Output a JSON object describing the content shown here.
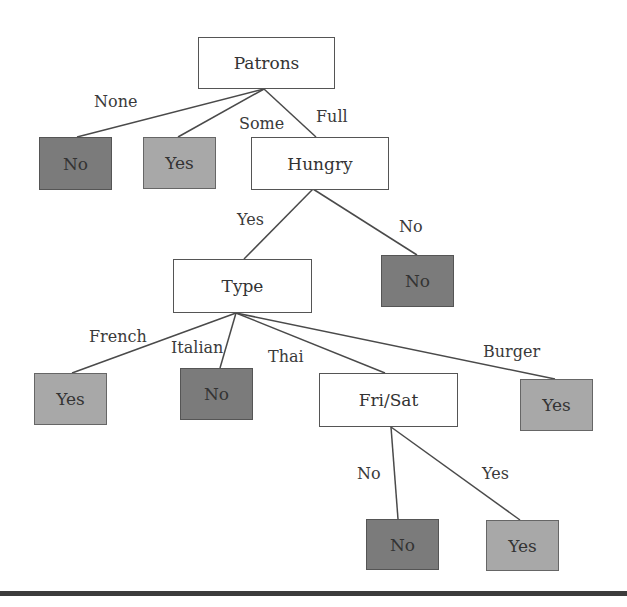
{
  "diagram": {
    "type": "decision-tree",
    "colors": {
      "decision_fill": "#ffffff",
      "leaf_yes_fill": "#a8a8a8",
      "leaf_no_fill": "#7b7b7b",
      "line": "#4a4a4a",
      "rule": "#3c3c3c"
    },
    "nodes": {
      "patrons": {
        "label": "Patrons",
        "kind": "decision"
      },
      "patrons_none": {
        "label": "No",
        "kind": "leaf-no"
      },
      "patrons_some": {
        "label": "Yes",
        "kind": "leaf-yes"
      },
      "hungry": {
        "label": "Hungry",
        "kind": "decision"
      },
      "hungry_no": {
        "label": "No",
        "kind": "leaf-no"
      },
      "type": {
        "label": "Type",
        "kind": "decision"
      },
      "type_french": {
        "label": "Yes",
        "kind": "leaf-yes"
      },
      "type_italian": {
        "label": "No",
        "kind": "leaf-no"
      },
      "frisat": {
        "label": "Fri/Sat",
        "kind": "decision"
      },
      "type_burger": {
        "label": "Yes",
        "kind": "leaf-yes"
      },
      "frisat_no": {
        "label": "No",
        "kind": "leaf-no"
      },
      "frisat_yes": {
        "label": "Yes",
        "kind": "leaf-yes"
      }
    },
    "edges": {
      "patrons_none": "None",
      "patrons_some": "Some",
      "patrons_full": "Full",
      "hungry_yes": "Yes",
      "hungry_no": "No",
      "type_french": "French",
      "type_italian": "Italian",
      "type_thai": "Thai",
      "type_burger": "Burger",
      "frisat_no": "No",
      "frisat_yes": "Yes"
    }
  }
}
